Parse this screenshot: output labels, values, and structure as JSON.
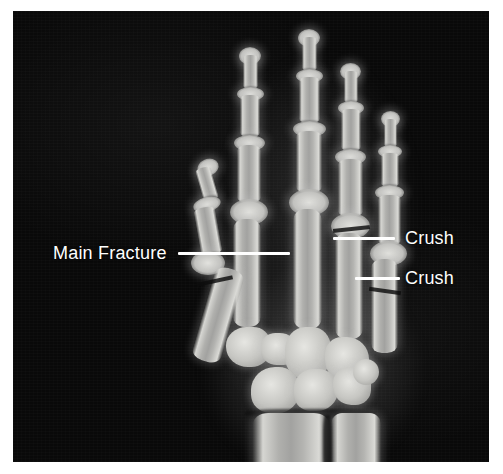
{
  "figure": {
    "modality": "X-ray",
    "view": "posteroanterior hand and wrist",
    "background_color": "#ffffff",
    "plate_color": "#090909",
    "annotation_color": "#ffffff"
  },
  "annotations": [
    {
      "id": "main-fracture",
      "label": "Main Fracture",
      "text_x": 53,
      "text_y": 243,
      "line_x": 178,
      "line_y": 252,
      "line_length": 112,
      "side": "left"
    },
    {
      "id": "crush-upper",
      "label": "Crush",
      "text_x": 405,
      "text_y": 228,
      "line_x": 333,
      "line_y": 237,
      "line_length": 62,
      "side": "right"
    },
    {
      "id": "crush-lower",
      "label": "Crush",
      "text_x": 405,
      "text_y": 268,
      "line_x": 355,
      "line_y": 277,
      "line_length": 45,
      "side": "right"
    }
  ]
}
